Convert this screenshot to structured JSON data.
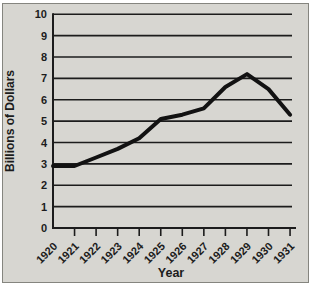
{
  "figure": {
    "background_color": "#ffffff",
    "panel_color": "#d7d6d1",
    "panel_border_color": "#85857f",
    "grid_color": "#1c1c1c",
    "line_color": "#121212",
    "text_color": "#1c1c1c"
  },
  "chart_data": {
    "type": "line",
    "title": "",
    "xlabel": "Year",
    "ylabel": "Billions of Dollars",
    "categories": [
      "1920",
      "1921",
      "1922",
      "1923",
      "1924",
      "1925",
      "1926",
      "1927",
      "1928",
      "1929",
      "1930",
      "1931"
    ],
    "series": [
      {
        "name": "Billions of Dollars",
        "values": [
          2.9,
          2.9,
          3.3,
          3.7,
          4.2,
          5.1,
          5.3,
          5.6,
          6.6,
          7.2,
          6.5,
          5.3
        ]
      }
    ],
    "ylim": [
      0,
      10
    ],
    "ytick_step": 1,
    "yticks": [
      "0",
      "1",
      "2",
      "3",
      "4",
      "5",
      "6",
      "7",
      "8",
      "9",
      "10"
    ],
    "grid": "horizontal",
    "legend": "none"
  }
}
